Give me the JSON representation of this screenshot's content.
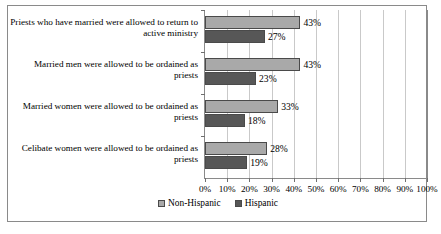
{
  "chart_data": {
    "type": "bar",
    "orientation": "horizontal",
    "title": "",
    "xlabel": "",
    "ylabel": "",
    "categories": [
      "Priests who have married were allowed to return to active ministry",
      "Married men were allowed to be ordained as priests",
      "Married women were allowed to be ordained as priests",
      "Celibate women were allowed to be ordained as priests"
    ],
    "series": [
      {
        "name": "Non-Hispanic",
        "color": "#a9a9a9",
        "values": [
          43,
          43,
          33,
          28
        ],
        "labels": [
          "43%",
          "43%",
          "33%",
          "28%"
        ]
      },
      {
        "name": "Hispanic",
        "color": "#575757",
        "values": [
          27,
          23,
          18,
          19
        ],
        "labels": [
          "27%",
          "23%",
          "18%",
          "19%"
        ]
      }
    ],
    "xlim": [
      0,
      100
    ],
    "xticks": [
      0,
      10,
      20,
      30,
      40,
      50,
      60,
      70,
      80,
      90,
      100
    ],
    "xtick_labels": [
      "0%",
      "10%",
      "20%",
      "30%",
      "40%",
      "50%",
      "60%",
      "70%",
      "80%",
      "90%",
      "100%"
    ],
    "grid": "vertical",
    "legend_position": "bottom"
  },
  "legend": {
    "items": [
      {
        "label": "Non-Hispanic"
      },
      {
        "label": "Hispanic"
      }
    ]
  }
}
